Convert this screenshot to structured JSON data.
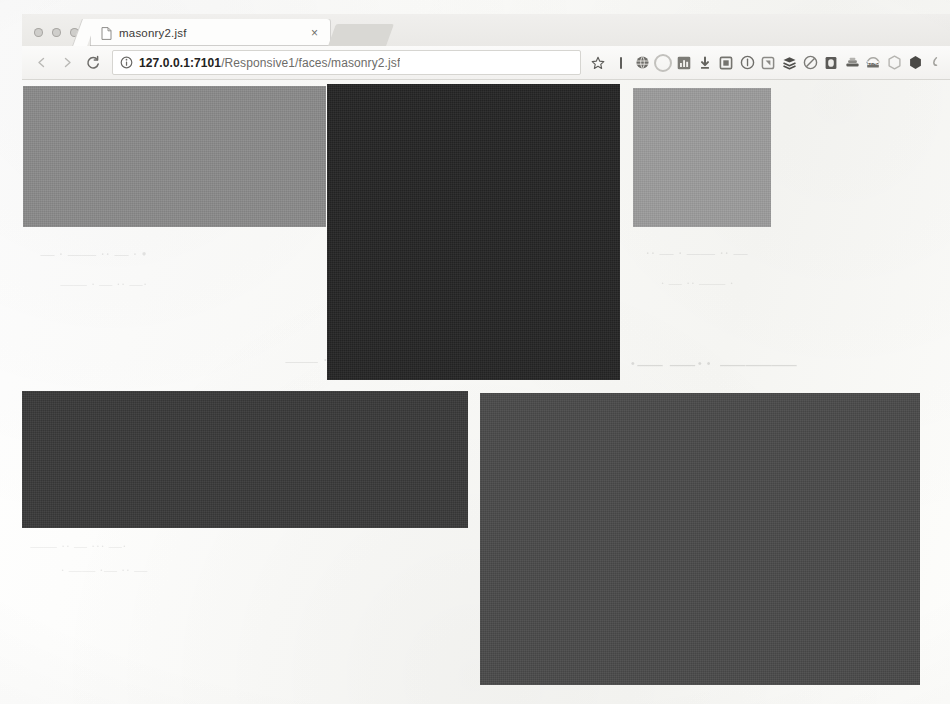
{
  "browser": {
    "window_controls": [
      "close",
      "minimize",
      "maximize"
    ],
    "tab": {
      "title": "masonry2.jsf",
      "favicon": "page-icon",
      "close_label": "×"
    },
    "nav": {
      "back_label": "←",
      "forward_label": "→",
      "reload_label": "C"
    },
    "omnibox": {
      "site_info_icon": "info-circle-icon",
      "url_host": "127.0.0.1:7101",
      "url_path": "/Responsive1/faces/masonry2.jsf",
      "url_full": "127.0.0.1:7101/Responsive1/faces/masonry2.jsf",
      "placeholder": "Search Google or type a URL",
      "bookmark_icon": "star-icon"
    },
    "extensions": [
      {
        "name": "extension-bar",
        "shape": "bar",
        "color": "#5f5e5b"
      },
      {
        "name": "extension-globe",
        "shape": "circ",
        "color": "#6e6d69"
      },
      {
        "name": "extension-circle",
        "shape": "circ-lt",
        "color": "#c2c1bd"
      },
      {
        "name": "extension-chart",
        "shape": "sq",
        "color": "#77766f"
      },
      {
        "name": "extension-download",
        "shape": "arrow",
        "color": "#6b6a66"
      },
      {
        "name": "extension-square",
        "shape": "sq-o",
        "color": "#7a7975"
      },
      {
        "name": "extension-info",
        "shape": "circ-o",
        "color": "#6f6e6a"
      },
      {
        "name": "extension-note",
        "shape": "sq-o",
        "color": "#8b8a86"
      },
      {
        "name": "extension-layers",
        "shape": "layers",
        "color": "#4f4e4b"
      },
      {
        "name": "extension-block",
        "shape": "circ-o",
        "color": "#7c7b77"
      },
      {
        "name": "extension-book",
        "shape": "sq",
        "color": "#5b5a57"
      },
      {
        "name": "extension-stack",
        "shape": "stack",
        "color": "#6a6965"
      },
      {
        "name": "extension-time-badge",
        "shape": "badge",
        "color": "#9a9995",
        "badge": "17:45"
      },
      {
        "name": "extension-hex-light",
        "shape": "hexs-o",
        "color": "#b6b5b1"
      },
      {
        "name": "extension-hex-dark",
        "shape": "hexs",
        "color": "#4a4946"
      },
      {
        "name": "extension-partial",
        "shape": "partial",
        "color": "#9a9995"
      }
    ]
  },
  "page": {
    "name": "masonry-grid",
    "tiles": [
      {
        "name": "masonry-tile-1",
        "color": "#8a8a8a",
        "x": 1,
        "y": 7,
        "w": 303,
        "h": 141
      },
      {
        "name": "masonry-tile-2",
        "color": "#242424",
        "x": 305,
        "y": 5,
        "w": 293,
        "h": 296
      },
      {
        "name": "masonry-tile-3",
        "color": "#9c9c9c",
        "x": 611,
        "y": 9,
        "w": 138,
        "h": 139
      },
      {
        "name": "masonry-tile-4",
        "color": "#393939",
        "x": 0,
        "y": 312,
        "w": 446,
        "h": 137
      },
      {
        "name": "masonry-tile-5",
        "color": "#4a4a4a",
        "x": 458,
        "y": 314,
        "w": 440,
        "h": 292
      }
    ],
    "background_artifacts": [
      "• · — ·· —— · —",
      "·— ·· — · ——",
      "— ·· —— · — ··",
      "· —— ·· — ·",
      "——— ··— —·",
      "·— ··· — ·· ——",
      "— ·· —· —— ·",
      "·· — · ——"
    ]
  }
}
